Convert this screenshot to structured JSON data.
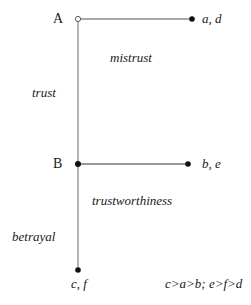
{
  "diagram": {
    "type": "game-tree",
    "nodes": {
      "A": {
        "label": "A"
      },
      "B": {
        "label": "B"
      }
    },
    "actions": {
      "trust": "trust",
      "mistrust": "mistrust",
      "trustworthiness": "trustworthiness",
      "betrayal": "betrayal"
    },
    "payoffs": {
      "mistrust": "a, d",
      "trustworthiness": "b, e",
      "betrayal": "c, f"
    },
    "condition": "c>a>b; e>f>d",
    "colors": {
      "trunk_line": "#8a8a8a",
      "branch_line": "#333333",
      "dot": "#111111"
    }
  }
}
